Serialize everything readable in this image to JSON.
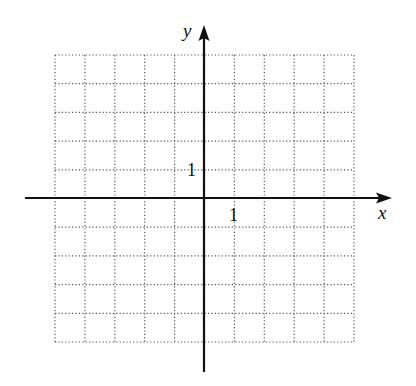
{
  "diagram": {
    "type": "coordinate-grid",
    "x_axis_label": "x",
    "y_axis_label": "y",
    "x_tick_label": "1",
    "y_tick_label": "1",
    "grid": {
      "x_range": [
        -5,
        5
      ],
      "y_range": [
        -5,
        5
      ],
      "style": "dotted"
    },
    "colors": {
      "axis": "#111111",
      "grid": "#555555",
      "background": "#ffffff"
    }
  }
}
